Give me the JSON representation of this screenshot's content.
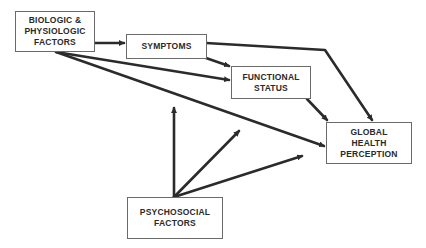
{
  "diagram": {
    "type": "path-model",
    "nodes": [
      {
        "id": "biologic",
        "lines": [
          "BIOLOGIC &",
          "PHYSIOLOGIC",
          "FACTORS"
        ]
      },
      {
        "id": "symptoms",
        "lines": [
          "SYMPTOMS"
        ]
      },
      {
        "id": "functional",
        "lines": [
          "FUNCTIONAL",
          "STATUS"
        ]
      },
      {
        "id": "global",
        "lines": [
          "GLOBAL",
          "HEALTH",
          "PERCEPTION"
        ]
      },
      {
        "id": "psychosocial",
        "lines": [
          "PSYCHOSOCIAL",
          "FACTORS"
        ]
      }
    ],
    "edges": [
      {
        "from": "biologic",
        "to": "symptoms"
      },
      {
        "from": "biologic",
        "to": "functional"
      },
      {
        "from": "biologic",
        "to": "global"
      },
      {
        "from": "symptoms",
        "to": "functional"
      },
      {
        "from": "symptoms",
        "to": "global"
      },
      {
        "from": "functional",
        "to": "global"
      },
      {
        "from": "psychosocial",
        "to": "biologic-symptoms path"
      },
      {
        "from": "psychosocial",
        "to": "biologic-functional path"
      },
      {
        "from": "psychosocial",
        "to": "biologic-global path"
      }
    ],
    "colors": {
      "line": "#2b2b2b",
      "border": "#6a6a6a",
      "text": "#2a2a2a",
      "background": "#ffffff"
    }
  }
}
